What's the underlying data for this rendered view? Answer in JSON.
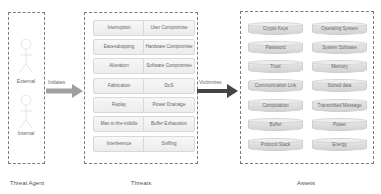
{
  "agent": {
    "caption": "Threat Agent",
    "figures": [
      {
        "label": "External"
      },
      {
        "label": "Internal"
      }
    ]
  },
  "arrows": {
    "initiates": {
      "label": "Initiates",
      "color": "#a0a0a0"
    },
    "victimizes": {
      "label": "Victimizes",
      "color": "#444444"
    }
  },
  "threats": {
    "caption": "Threats",
    "left": [
      "Interruption",
      "Eavesdropping",
      "Alteration",
      "Fabrication",
      "Replay",
      "Man-in-the-middle",
      "Interference"
    ],
    "right": [
      "User Compromise",
      "Hardware Compromise",
      "Software Compromise",
      "DoS",
      "Power Drainage",
      "Buffer Exhaustion",
      "Sniffing"
    ]
  },
  "assets": {
    "caption": "Assets",
    "left": [
      "Crypto Keys",
      "Password",
      "Trust",
      "Communication Link",
      "Computation",
      "Buffer",
      "Protocol Stack"
    ],
    "right": [
      "Operating System",
      "System Software",
      "Memory",
      "Stored data",
      "Transmitted Message",
      "Power",
      "Energy"
    ]
  }
}
